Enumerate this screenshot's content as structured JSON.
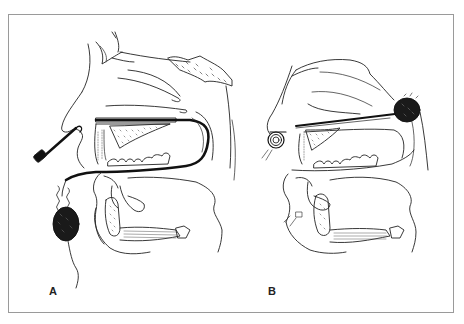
{
  "figure": {
    "panels": [
      {
        "label": "A",
        "description": "Sagittal section of head: nasal probe inserted through nostril, dark tube running along hard palate and soft palate, coiled wire exiting below chin to a dark sponge-like mass"
      },
      {
        "label": "B",
        "description": "Sagittal section of head: coiled device at nostril, tube along floor of nasal cavity ending in a dark mass at the nasopharynx"
      }
    ],
    "colors": {
      "frame": "#9a9a9a",
      "line": "#222222",
      "fill_dark": "#1a1a1a",
      "background": "#ffffff"
    }
  }
}
